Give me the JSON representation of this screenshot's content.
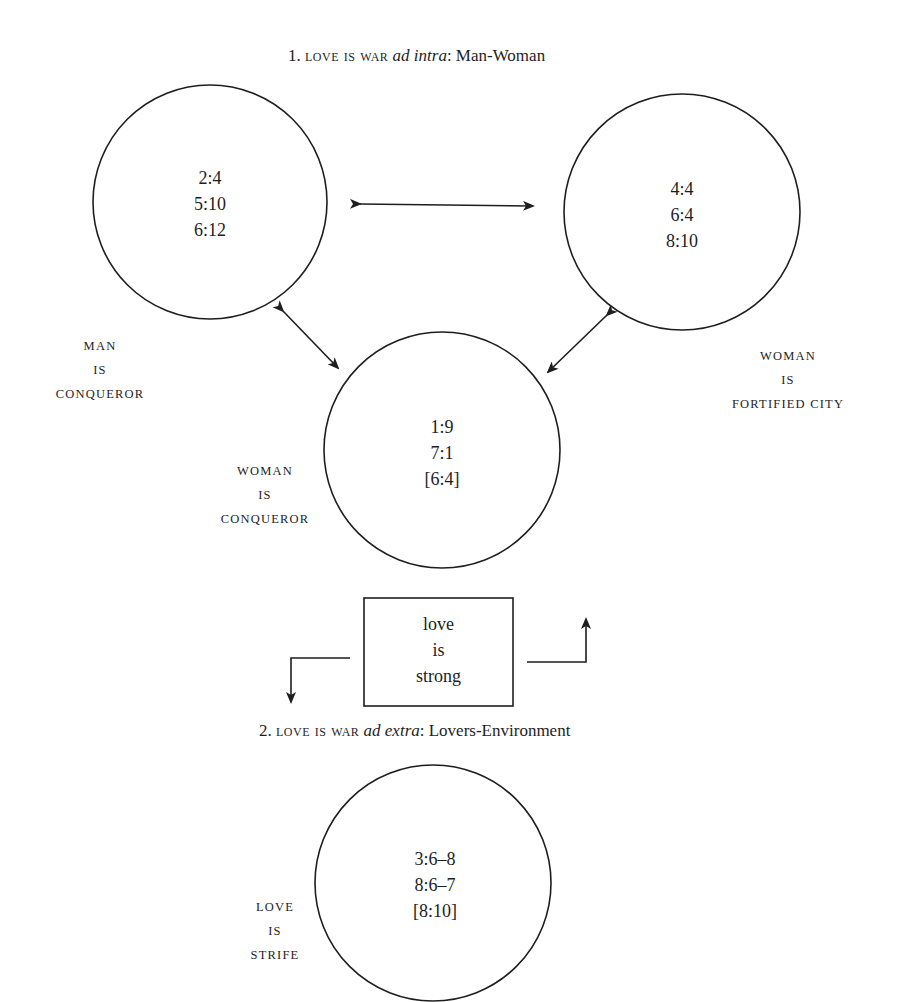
{
  "section1": {
    "number": "1.",
    "metaphor": "love is war",
    "qualifier": "ad intra",
    "subject": ": Man-Woman"
  },
  "section2": {
    "number": "2.",
    "metaphor": "love is war",
    "qualifier": "ad extra",
    "subject": ": Lovers-Environment"
  },
  "circles": {
    "man": {
      "refs": [
        "2:4",
        "5:10",
        "6:12"
      ]
    },
    "woman_city": {
      "refs": [
        "4:4",
        "6:4",
        "8:10"
      ]
    },
    "woman_conqueror": {
      "refs": [
        "1:9",
        "7:1",
        "[6:4]"
      ]
    },
    "environment": {
      "refs": [
        "3:6–8",
        "8:6–7",
        "[8:10]"
      ]
    }
  },
  "labels": {
    "man_conqueror": [
      "MAN",
      "IS",
      "CONQUEROR"
    ],
    "woman_fortified_city": [
      "WOMAN",
      "IS",
      "FORTIFIED CITY"
    ],
    "woman_conqueror": [
      "WOMAN",
      "IS",
      "CONQUEROR"
    ],
    "love_strife": [
      "LOVE",
      "IS",
      "STRIFE"
    ]
  },
  "center_box": {
    "lines": [
      "love",
      "is",
      "strong"
    ]
  },
  "colors": {
    "ink": "#1e1e1e",
    "background": "#ffffff"
  }
}
